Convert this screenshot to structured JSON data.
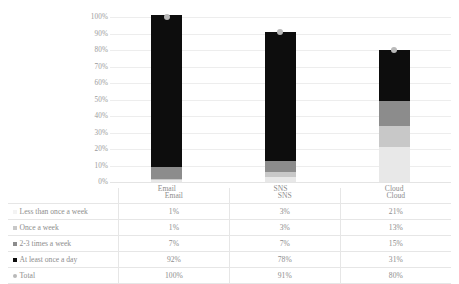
{
  "chart_data": {
    "type": "bar",
    "stacked": true,
    "title": "",
    "xlabel": "",
    "ylabel": "",
    "categories": [
      "Email",
      "SNS",
      "Cloud"
    ],
    "ylim": [
      0,
      100
    ],
    "ytick_labels": [
      "100%",
      "90%",
      "80%",
      "70%",
      "60%",
      "50%",
      "40%",
      "30%",
      "20%",
      "10%",
      "0%"
    ],
    "ytick_values": [
      100,
      90,
      80,
      70,
      60,
      50,
      40,
      30,
      20,
      10,
      0
    ],
    "grid": true,
    "legend_position": "table-left-column",
    "series": [
      {
        "name": "Less than once a week",
        "marker": "square",
        "color": "#e8e8e8",
        "values": [
          1,
          3,
          21
        ],
        "labels": [
          "1%",
          "3%",
          "21%"
        ]
      },
      {
        "name": "Once a week",
        "marker": "square",
        "color": "#c8c8c8",
        "values": [
          1,
          3,
          13
        ],
        "labels": [
          "1%",
          "3%",
          "13%"
        ]
      },
      {
        "name": "2-3 times a week",
        "marker": "square",
        "color": "#8c8c8c",
        "values": [
          7,
          7,
          15
        ],
        "labels": [
          "7%",
          "7%",
          "15%"
        ]
      },
      {
        "name": "At least once a day",
        "marker": "square",
        "color": "#0d0d0d",
        "values": [
          92,
          78,
          31
        ],
        "labels": [
          "92%",
          "78%",
          "31%"
        ]
      },
      {
        "name": "Total",
        "marker": "circle",
        "type": "scatter",
        "color": "#b9b9b9",
        "values": [
          100,
          91,
          80
        ],
        "labels": [
          "100%",
          "91%",
          "80%"
        ]
      }
    ]
  },
  "table": {
    "header_blank": "",
    "columns": [
      "Email",
      "SNS",
      "Cloud"
    ],
    "rows": [
      {
        "label": "Less than once a week",
        "marker": "square",
        "color": "#f3f3f3",
        "values": [
          "1%",
          "3%",
          "21%"
        ]
      },
      {
        "label": "Once a week",
        "marker": "square",
        "color": "#c8c8c8",
        "values": [
          "1%",
          "3%",
          "13%"
        ]
      },
      {
        "label": "2-3 times a week",
        "marker": "square",
        "color": "#8c8c8c",
        "values": [
          "7%",
          "7%",
          "15%"
        ]
      },
      {
        "label": "At least once a day",
        "marker": "square",
        "color": "#0d0d0d",
        "values": [
          "92%",
          "78%",
          "31%"
        ]
      },
      {
        "label": "Total",
        "marker": "circle",
        "color": "#b9b9b9",
        "values": [
          "100%",
          "91%",
          "80%"
        ]
      }
    ]
  },
  "colors": {
    "gridline": "#ededed",
    "axis_text": "#9a9a9a",
    "table_border": "#e6e6e6",
    "background": "#ffffff"
  }
}
